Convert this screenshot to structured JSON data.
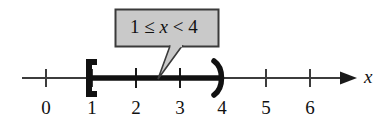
{
  "figure": {
    "type": "number-line-inequality",
    "axis_label": "x",
    "tick_labels": [
      "0",
      "1",
      "2",
      "3",
      "4",
      "5",
      "6"
    ],
    "tick_values": [
      0,
      1,
      2,
      3,
      4,
      5,
      6
    ],
    "axis_range": [
      -0.55,
      7.1
    ],
    "arrow_direction": "right"
  },
  "callout": {
    "full_text": "1 ≤ x < 4",
    "left_value": "1",
    "left_operator": "≤",
    "variable": "x",
    "right_operator": "<",
    "right_value": "4",
    "fill_color": "#c9c9c9",
    "border_color": "#3a3a3a"
  },
  "interval": {
    "start_value": "1",
    "start_endpoint": "closed",
    "start_symbol": "[",
    "end_value": "4",
    "end_endpoint": "open",
    "end_symbol": ")",
    "highlight_color": "#111111"
  },
  "colors": {
    "line": "#3c3c3c",
    "ink": "#111111",
    "background": "#ffffff"
  }
}
